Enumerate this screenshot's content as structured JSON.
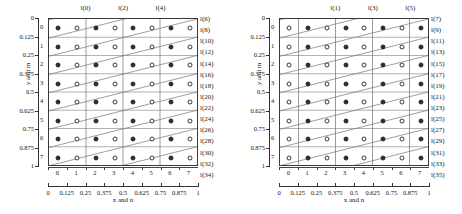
{
  "figure": {
    "title": "",
    "panel_count": 2
  },
  "chart_data": {
    "type": "scatter",
    "title": "",
    "panels": [
      {
        "name": "left-panel",
        "xlabel": "x and n",
        "ylabel": "y and m",
        "xlim": [
          0,
          1
        ],
        "ylim": [
          1,
          0
        ],
        "grid": true,
        "x_tick_labels_outer": [
          "0",
          "0.125",
          "0.25",
          "0.375",
          "0.5",
          "0.625",
          "0.75",
          "0.875",
          "1"
        ],
        "x_tick_values_outer": [
          0,
          0.125,
          0.25,
          0.375,
          0.5,
          0.625,
          0.75,
          0.875,
          1
        ],
        "x_tick_labels_inner": [
          "0",
          "1",
          "2",
          "3",
          "4",
          "5",
          "6",
          "7"
        ],
        "y_tick_labels_outer": [
          "0",
          "0.125",
          "0.25",
          "0.375",
          "0.5",
          "0.625",
          "0.75",
          "0.875",
          "1"
        ],
        "y_tick_values_outer": [
          0,
          0.125,
          0.25,
          0.375,
          0.5,
          0.625,
          0.75,
          0.875,
          1
        ],
        "y_tick_labels_inner": [
          "0",
          "1",
          "2",
          "3",
          "4",
          "5",
          "6",
          "7"
        ],
        "top_labels": [
          "l(0)",
          "l(2)",
          "l(4)"
        ],
        "top_label_columns": [
          2,
          4,
          6
        ],
        "right_labels": [
          "l(6)",
          "l(8)",
          "l(10)",
          "l(12)",
          "l(14)",
          "l(16)",
          "l(18)",
          "l(20)",
          "l(22)",
          "l(24)",
          "l(26)",
          "l(28)",
          "l(30)",
          "l(32)",
          "l(34)"
        ],
        "marker_pattern_first_is_filled": true,
        "rows": 8,
        "cols": 8,
        "legend": {
          "filled": "even-index node",
          "open": "odd-index node"
        }
      },
      {
        "name": "right-panel",
        "xlabel": "x and n",
        "ylabel": "y and m",
        "xlim": [
          0,
          1
        ],
        "ylim": [
          1,
          0
        ],
        "grid": true,
        "x_tick_labels_outer": [
          "0",
          "0.125",
          "0.25",
          "0.375",
          "0.5",
          "0.625",
          "0.75",
          "0.875",
          "1"
        ],
        "x_tick_values_outer": [
          0,
          0.125,
          0.25,
          0.375,
          0.5,
          0.625,
          0.75,
          0.875,
          1
        ],
        "x_tick_labels_inner": [
          "0",
          "1",
          "2",
          "3",
          "4",
          "5",
          "6",
          "7"
        ],
        "y_tick_labels_outer": [
          "0",
          "0.125",
          "0.25",
          "0.375",
          "0.5",
          "0.625",
          "0.75",
          "0.875",
          "1"
        ],
        "y_tick_values_outer": [
          0,
          0.125,
          0.25,
          0.375,
          0.5,
          0.625,
          0.75,
          0.875,
          1
        ],
        "y_tick_labels_inner": [
          "0",
          "1",
          "2",
          "3",
          "4",
          "5",
          "6",
          "7"
        ],
        "top_labels": [
          "l(1)",
          "l(3)",
          "l(5)"
        ],
        "top_label_columns": [
          3,
          5,
          7
        ],
        "right_labels": [
          "l(7)",
          "l(9)",
          "l(11)",
          "l(13)",
          "l(15)",
          "l(17)",
          "l(19)",
          "l(21)",
          "l(23)",
          "l(25)",
          "l(27)",
          "l(29)",
          "l(31)",
          "l(33)",
          "l(35)"
        ],
        "marker_pattern_first_is_filled": false,
        "rows": 8,
        "cols": 8,
        "legend": {
          "filled": "odd-index node",
          "open": "even-index node"
        }
      }
    ],
    "colors": {
      "marker_fill": "#2b2b2b",
      "marker_stroke": "#3a3a3a",
      "grid": "#8a8a8a",
      "diagonal": "#6f6f6f",
      "frame": "#3a3a3a",
      "text": "#141414",
      "background": "#ffffff"
    }
  }
}
